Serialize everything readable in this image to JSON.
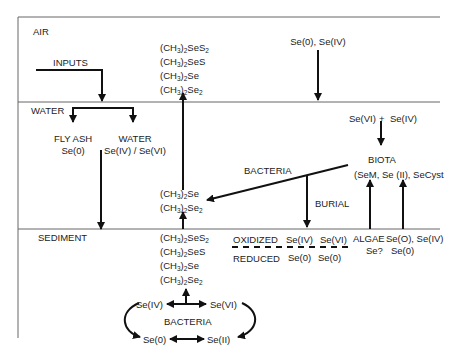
{
  "zones": {
    "air": "AIR",
    "water": "WATER",
    "sediment": "SEDIMENT"
  },
  "labels": {
    "inputs": "INPUTS",
    "fly_ash": "FLY ASH",
    "fly_ash_species": "Se(0)",
    "water": "WATER",
    "water_species": "Se(IV) / Se(VI)",
    "air_deposition": "Se(0), Se(IV)",
    "bacteria_water": "BACTERIA",
    "burial": "BURIAL",
    "biota_input_left": "Se(VI)",
    "biota_input_plus": "+",
    "biota_input_right": "Se(IV)",
    "biota": "BIOTA",
    "biota_species": "(SeM, Se (II), SeCyst",
    "oxidized": "OXIDIZED",
    "reduced": "REDUCED",
    "ox_se_iv": "Se(IV)",
    "ox_se_vi": "Se(VI)",
    "red_se0_a": "Se(0)",
    "red_se0_b": "Se(0)",
    "algae": "ALGAE",
    "algae_species_top": "Se(O), Se(IV)",
    "algae_se_q": "Se?",
    "algae_se0": "Se(0)",
    "cycle_se_iv": "Se(IV)",
    "cycle_se_vi": "Se(VI)",
    "cycle_se_0": "Se(0)",
    "cycle_se_ii": "Se(II)",
    "bacteria_cycle": "BACTERIA"
  },
  "methyl_air": [
    "(CH3)2SeS2",
    "(CH3)2SeS",
    "(CH3)2Se",
    "(CH3)2Se2"
  ],
  "methyl_water": [
    "(CH3)2Se",
    "(CH3)2Se2"
  ],
  "methyl_sediment": [
    "(CH3)2SeS2",
    "(CH3)2SeS",
    "(CH3)2Se",
    "(CH3)2Se2"
  ]
}
